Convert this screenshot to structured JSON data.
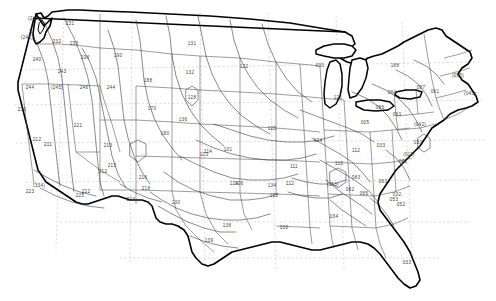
{
  "map": {
    "title": "United States Zone Contour Map",
    "region": "Contiguous United States",
    "style": "line-drawing",
    "colors": {
      "coastline": "#000000",
      "state_border": "#3a3a3a",
      "contour_line": "#2b2b2b",
      "grid_line": "#9a9a9a",
      "label_text": "#3d3d3d",
      "background": "#ffffff"
    },
    "zone_labels": [
      {
        "id": "z-242",
        "text": "(242)",
        "x": 34,
        "y": 19
      },
      {
        "id": "z-241",
        "text": "(241)",
        "x": 27,
        "y": 38
      },
      {
        "id": "z-231",
        "text": "231",
        "x": 70,
        "y": 24
      },
      {
        "id": "z-232",
        "text": "232",
        "x": 57,
        "y": 42
      },
      {
        "id": "z-240",
        "text": "240",
        "x": 37,
        "y": 60
      },
      {
        "id": "z-233",
        "text": "233",
        "x": 74,
        "y": 44
      },
      {
        "id": "z-234",
        "text": "234",
        "x": 85,
        "y": 58
      },
      {
        "id": "z-243",
        "text": "243",
        "x": 62,
        "y": 72
      },
      {
        "id": "z-244",
        "text": "244",
        "x": 30,
        "y": 88
      },
      {
        "id": "z-245",
        "text": "(245)",
        "x": 57,
        "y": 88
      },
      {
        "id": "z-246",
        "text": "246",
        "x": 84,
        "y": 88
      },
      {
        "id": "z-244b",
        "text": "244",
        "x": 111,
        "y": 88
      },
      {
        "id": "z-190",
        "text": "190",
        "x": 118,
        "y": 56
      },
      {
        "id": "z-188",
        "text": "188",
        "x": 148,
        "y": 81
      },
      {
        "id": "z-131",
        "text": "131",
        "x": 192,
        "y": 44
      },
      {
        "id": "z-132",
        "text": "132",
        "x": 190,
        "y": 73
      },
      {
        "id": "z-128",
        "text": "128",
        "x": 192,
        "y": 98
      },
      {
        "id": "z-122",
        "text": "122",
        "x": 244,
        "y": 67
      },
      {
        "id": "z-170",
        "text": "170",
        "x": 152,
        "y": 109
      },
      {
        "id": "z-136",
        "text": "136",
        "x": 183,
        "y": 120
      },
      {
        "id": "z-180",
        "text": "180",
        "x": 165,
        "y": 134
      },
      {
        "id": "z-230",
        "text": "230",
        "x": 22,
        "y": 110
      },
      {
        "id": "z-221",
        "text": "221",
        "x": 78,
        "y": 126
      },
      {
        "id": "z-211",
        "text": "211",
        "x": 48,
        "y": 145
      },
      {
        "id": "z-212",
        "text": "212",
        "x": 37,
        "y": 140
      },
      {
        "id": "z-213",
        "text": "213",
        "x": 108,
        "y": 146
      },
      {
        "id": "z-215",
        "text": "215",
        "x": 112,
        "y": 166
      },
      {
        "id": "z-216",
        "text": "216",
        "x": 143,
        "y": 178
      },
      {
        "id": "z-212b",
        "text": "212",
        "x": 103,
        "y": 172
      },
      {
        "id": "z-222",
        "text": "222",
        "x": 86,
        "y": 192
      },
      {
        "id": "z-223",
        "text": "223",
        "x": 30,
        "y": 192
      },
      {
        "id": "z-224",
        "text": "224",
        "x": 131,
        "y": 200
      },
      {
        "id": "z-334",
        "text": "(334)",
        "x": 39,
        "y": 186
      },
      {
        "id": "z-225",
        "text": "225",
        "x": 80,
        "y": 196
      },
      {
        "id": "z-218",
        "text": "218",
        "x": 146,
        "y": 189
      },
      {
        "id": "z-130",
        "text": "130",
        "x": 176,
        "y": 203
      },
      {
        "id": "z-123",
        "text": "123",
        "x": 204,
        "y": 155
      },
      {
        "id": "z-125",
        "text": "125",
        "x": 272,
        "y": 129
      },
      {
        "id": "z-126",
        "text": "126",
        "x": 239,
        "y": 184
      },
      {
        "id": "z-114",
        "text": "114",
        "x": 208,
        "y": 152
      },
      {
        "id": "z-101",
        "text": "101",
        "x": 228,
        "y": 150
      },
      {
        "id": "z-124",
        "text": "124",
        "x": 234,
        "y": 184
      },
      {
        "id": "z-138",
        "text": "138",
        "x": 227,
        "y": 226
      },
      {
        "id": "z-139",
        "text": "139",
        "x": 209,
        "y": 241
      },
      {
        "id": "z-134",
        "text": "134",
        "x": 272,
        "y": 186
      },
      {
        "id": "z-132b",
        "text": "132",
        "x": 274,
        "y": 196
      },
      {
        "id": "z-112",
        "text": "112",
        "x": 290,
        "y": 184
      },
      {
        "id": "z-111",
        "text": "111",
        "x": 294,
        "y": 167
      },
      {
        "id": "z-121",
        "text": "121",
        "x": 338,
        "y": 98
      },
      {
        "id": "z-030",
        "text": "030",
        "x": 320,
        "y": 66
      },
      {
        "id": "z-124b",
        "text": "124",
        "x": 318,
        "y": 141
      },
      {
        "id": "z-113",
        "text": "113",
        "x": 339,
        "y": 164
      },
      {
        "id": "z-112b",
        "text": "112",
        "x": 356,
        "y": 151
      },
      {
        "id": "z-033",
        "text": "033",
        "x": 381,
        "y": 146
      },
      {
        "id": "z-113b",
        "text": "(113)",
        "x": 333,
        "y": 185
      },
      {
        "id": "z-083",
        "text": "083",
        "x": 356,
        "y": 178
      },
      {
        "id": "z-082",
        "text": "082",
        "x": 350,
        "y": 190
      },
      {
        "id": "z-063",
        "text": "063",
        "x": 383,
        "y": 182
      },
      {
        "id": "z-034",
        "text": "034",
        "x": 334,
        "y": 217
      },
      {
        "id": "z-036",
        "text": "036",
        "x": 284,
        "y": 228
      },
      {
        "id": "z-188b",
        "text": "188",
        "x": 395,
        "y": 66
      },
      {
        "id": "z-095",
        "text": "(095)",
        "x": 458,
        "y": 76
      },
      {
        "id": "z-081",
        "text": "081",
        "x": 392,
        "y": 93
      },
      {
        "id": "z-087",
        "text": "087",
        "x": 421,
        "y": 88
      },
      {
        "id": "z-061",
        "text": "061",
        "x": 435,
        "y": 92
      },
      {
        "id": "z-045",
        "text": "(045)",
        "x": 470,
        "y": 94
      },
      {
        "id": "z-063b",
        "text": "063",
        "x": 397,
        "y": 115
      },
      {
        "id": "z-042",
        "text": "(042)",
        "x": 420,
        "y": 125
      },
      {
        "id": "z-031",
        "text": "031",
        "x": 418,
        "y": 143
      },
      {
        "id": "z-011",
        "text": "(011)",
        "x": 409,
        "y": 155
      },
      {
        "id": "z-041",
        "text": "041",
        "x": 403,
        "y": 162
      },
      {
        "id": "z-032",
        "text": "032",
        "x": 397,
        "y": 195
      },
      {
        "id": "z-052",
        "text": "052",
        "x": 401,
        "y": 205
      },
      {
        "id": "z-065",
        "text": "065",
        "x": 364,
        "y": 194
      },
      {
        "id": "z-053",
        "text": "053",
        "x": 394,
        "y": 200
      },
      {
        "id": "z-033b",
        "text": "033",
        "x": 407,
        "y": 263
      },
      {
        "id": "z-005",
        "text": "005",
        "x": 365,
        "y": 123
      },
      {
        "id": "z-086",
        "text": "086",
        "x": 380,
        "y": 108
      }
    ]
  }
}
